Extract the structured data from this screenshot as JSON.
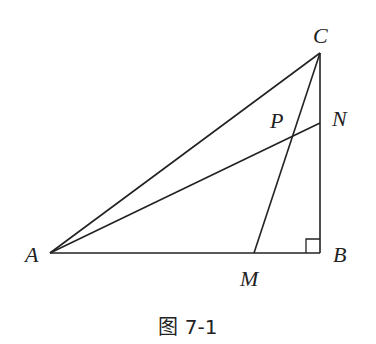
{
  "figure": {
    "caption": "图 7-1",
    "stroke_color": "#222222",
    "background": "#ffffff"
  },
  "points": {
    "A": {
      "label": "A",
      "x": 50,
      "y": 253
    },
    "B": {
      "label": "B",
      "x": 320,
      "y": 253
    },
    "C": {
      "label": "C",
      "x": 320,
      "y": 53
    },
    "N": {
      "label": "N",
      "x": 320,
      "y": 123
    },
    "M": {
      "label": "M",
      "x": 254,
      "y": 253
    },
    "P": {
      "label": "P",
      "x": 293,
      "y": 135
    }
  },
  "segments": [
    "AB",
    "BC",
    "CA",
    "AN",
    "CM"
  ],
  "right_angle": {
    "vertex": "B",
    "size": 14
  }
}
